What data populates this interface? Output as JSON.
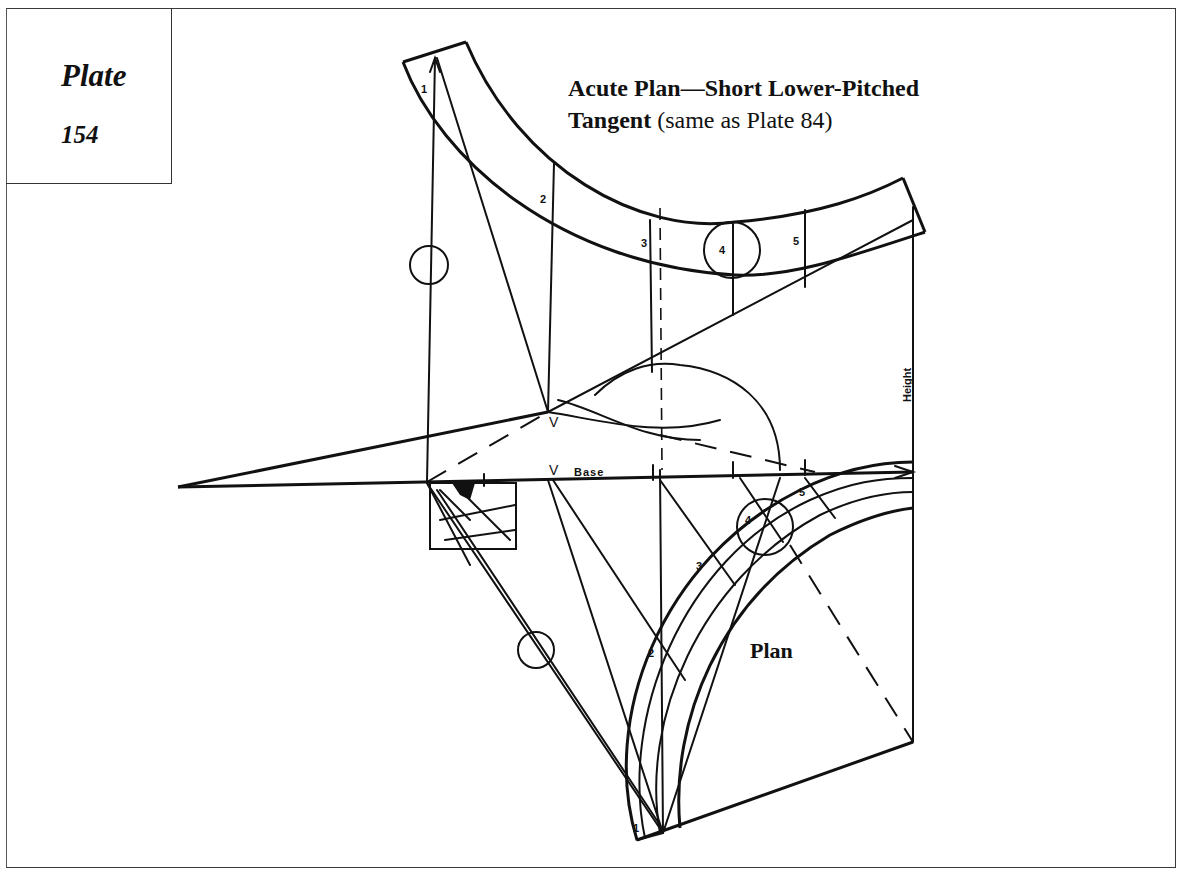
{
  "plate": {
    "word": "Plate",
    "number": "154"
  },
  "title": {
    "bold_part": "Acute Plan—Short Lower-Pitched",
    "line2_bold": "Tangent",
    "line2_normal": " (same as Plate 84)"
  },
  "labels": {
    "section_numbers_upper": [
      "1",
      "2",
      "3",
      "4",
      "5"
    ],
    "section_numbers_plan": [
      "1",
      "2",
      "3",
      "4",
      "5"
    ],
    "v_upper": "V",
    "v_base": "V",
    "base": "Base",
    "height": "Height",
    "plan": "Plan"
  },
  "colors": {
    "ink": "#111111",
    "paper": "#ffffff",
    "frame": "#3a3a3a"
  }
}
